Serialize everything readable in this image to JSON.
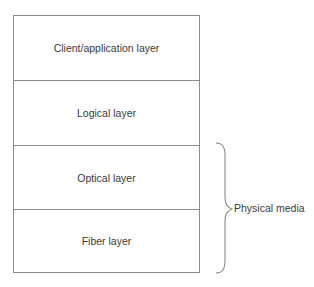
{
  "diagram": {
    "layers": [
      {
        "label": "Client/application layer"
      },
      {
        "label": "Logical layer"
      },
      {
        "label": "Optical layer"
      },
      {
        "label": "Fiber layer"
      }
    ],
    "brace": {
      "label": "Physical media",
      "spans_layers": [
        "Optical layer",
        "Fiber layer"
      ]
    },
    "colors": {
      "line": "#8a8a8a",
      "text": "#3a3a3a",
      "background": "#ffffff"
    }
  }
}
